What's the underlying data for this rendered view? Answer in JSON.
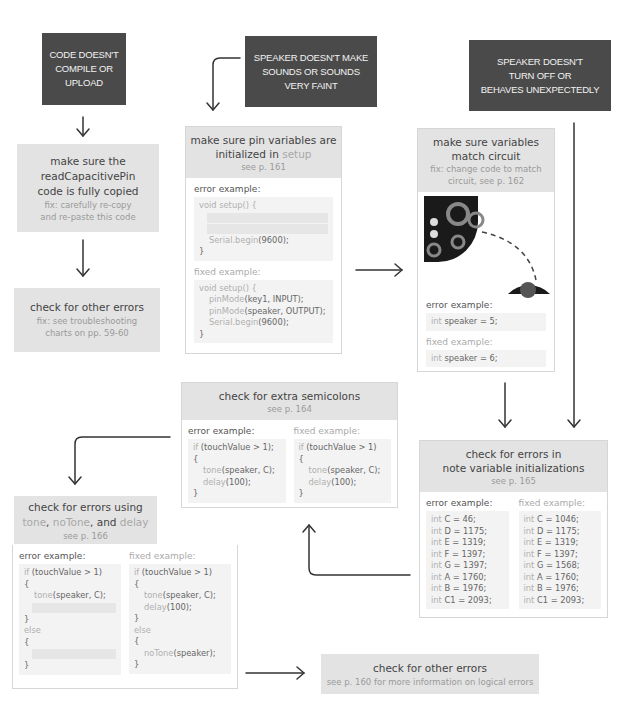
{
  "top_row": {
    "problem_1": {
      "lines": [
        "CODE DOESN'T",
        "COMPILE OR",
        "UPLOAD"
      ]
    },
    "problem_2": {
      "lines": [
        "SPEAKER DOESN'T MAKE",
        "SOUNDS OR SOUNDS",
        "VERY FAINT"
      ]
    },
    "problem_3": {
      "lines": [
        "SPEAKER DOESN'T",
        "TURN OFF OR",
        "BEHAVES UNEXPECTEDLY"
      ]
    }
  },
  "left_column": {
    "copied_box": {
      "title_lines": [
        "make sure the",
        "readCapacitivePin",
        "code is fully copied"
      ],
      "fix_lines": [
        "fix: carefully re-copy",
        "and re-paste this code"
      ]
    },
    "other_errors_box": {
      "title": "check for other errors",
      "fix_lines": [
        "fix: see troubleshooting",
        "charts on pp. 59-60"
      ]
    }
  },
  "setup_card": {
    "title_line1": "make sure pin variables are",
    "title_line2_prefix": "initialized in ",
    "title_line2_kw": "setup",
    "see": "see p. 161",
    "error_label": "error example:",
    "error_code": {
      "open": "void setup() {",
      "serial_kw": "Serial.begin",
      "serial_rest": "(9600);",
      "close": "}"
    },
    "fixed_label": "fixed example:",
    "fixed_code": {
      "open": "void setup() {",
      "line1_kw": "pinMode",
      "line1_rest": "(key1, INPUT);",
      "line2_kw": "pinMode",
      "line2_rest": "(speaker, OUTPUT);",
      "serial_kw": "Serial.begin",
      "serial_rest": "(9600);",
      "close": "}"
    }
  },
  "circuit_card": {
    "title_lines": [
      "make sure variables",
      "match circuit"
    ],
    "fix_lines": [
      "fix: change code to match",
      "circuit, see p. 162"
    ],
    "image_alt": "circuit board with dashed wire to speaker",
    "error_label": "error example:",
    "error_code": {
      "kw": "int",
      "rest": " speaker = 5;"
    },
    "fixed_label": "fixed example:",
    "fixed_code": {
      "kw": "int",
      "rest": " speaker = 6;"
    }
  },
  "semicolon_card": {
    "title": "check for extra semicolons",
    "see": "see p. 164",
    "error_label": "error example:",
    "error_code": [
      {
        "kw": "if",
        "rest": " (touchValue > 1);"
      },
      {
        "kw": "",
        "rest": "{"
      },
      {
        "kw": "tone",
        "rest": "(speaker, C);",
        "indent": true
      },
      {
        "kw": "delay",
        "rest": "(100);",
        "indent": true
      },
      {
        "kw": "",
        "rest": "}"
      }
    ],
    "fixed_label": "fixed example:",
    "fixed_code": [
      {
        "kw": "if",
        "rest": " (touchValue > 1)"
      },
      {
        "kw": "",
        "rest": "{"
      },
      {
        "kw": "tone",
        "rest": "(speaker, C);",
        "indent": true
      },
      {
        "kw": "delay",
        "rest": "(100);",
        "indent": true
      },
      {
        "kw": "",
        "rest": "}"
      }
    ]
  },
  "note_card": {
    "title_lines": [
      "check for errors in",
      "note variable initializations"
    ],
    "see": "see p. 165",
    "error_label": "error example:",
    "error_code": [
      "C = 46;",
      "D = 1175;",
      "E = 1319;",
      "F = 1397;",
      "G = 1397;",
      "A = 1760;",
      "B = 1976;",
      "C1 = 2093;"
    ],
    "fixed_label": "fixed example:",
    "fixed_code": [
      "C = 1046;",
      "D = 1175;",
      "E = 1319;",
      "F = 1397;",
      "G = 1568;",
      "A = 1760;",
      "B = 1976;",
      "C1 = 2093;"
    ],
    "kw": "int"
  },
  "tone_card": {
    "title": "check for errors using",
    "kw1": "tone",
    "sep1": ", ",
    "kw2": "noTone",
    "sep2": ", and ",
    "kw3": "delay",
    "see": "see p. 166",
    "error_label": "error example:",
    "error_code": {
      "if_kw": "if",
      "if_rest": " (touchValue > 1)",
      "open": "{",
      "tone_kw": "tone",
      "tone_rest": "(speaker, C);",
      "close": "}",
      "else_kw": "else",
      "open2": "{",
      "close2": "}"
    },
    "fixed_label": "fixed example:",
    "fixed_code": {
      "if_kw": "if",
      "if_rest": " (touchValue > 1)",
      "open": "{",
      "tone_kw": "tone",
      "tone_rest": "(speaker, C);",
      "delay_kw": "delay",
      "delay_rest": "(100);",
      "close": "}",
      "else_kw": "else",
      "open2": "{",
      "notone_kw": "noTone",
      "notone_rest": "(speaker);",
      "close2": "}"
    }
  },
  "final_box": {
    "title": "check for other errors",
    "see": "see p. 160 for more information on logical errors"
  },
  "colors": {
    "dark_box": "#4a4a4a",
    "gray_box": "#e3e3e3",
    "code_bg": "#f3f3f3",
    "arrow": "#333333"
  }
}
